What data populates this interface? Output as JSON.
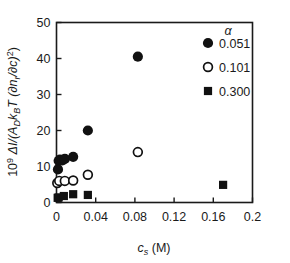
{
  "chart_data": {
    "type": "scatter",
    "title": "",
    "xlabel": "c_s (M)",
    "ylabel": "10^9 ΔI/(A_D k_B T (∂n_r/∂c)^2)",
    "xlim": [
      0,
      0.2
    ],
    "ylim": [
      0,
      50
    ],
    "xticks": [
      "0",
      "0.04",
      "0.08",
      "0.12",
      "0.16",
      "0.2"
    ],
    "xtick_values": [
      0,
      0.04,
      0.08,
      0.12,
      0.16,
      0.2
    ],
    "yticks": [
      "0",
      "10",
      "20",
      "30",
      "40",
      "50"
    ],
    "ytick_values": [
      0,
      10,
      20,
      30,
      40,
      50
    ],
    "grid": false,
    "legend_position": "top-right",
    "legend_title": "α",
    "series": [
      {
        "name": "0.051",
        "marker": "filled-circle",
        "color": "#111111",
        "points": [
          {
            "x": 0.0015,
            "y": 9.2
          },
          {
            "x": 0.0022,
            "y": 11.6
          },
          {
            "x": 0.0035,
            "y": 11.9
          },
          {
            "x": 0.006,
            "y": 11.7
          },
          {
            "x": 0.0085,
            "y": 12.1
          },
          {
            "x": 0.017,
            "y": 12.7
          },
          {
            "x": 0.032,
            "y": 20.0
          },
          {
            "x": 0.083,
            "y": 40.5
          }
        ]
      },
      {
        "name": "0.101",
        "marker": "open-circle",
        "color": "#111111",
        "points": [
          {
            "x": 0.0008,
            "y": 5.4
          },
          {
            "x": 0.0028,
            "y": 6.0
          },
          {
            "x": 0.0085,
            "y": 6.0
          },
          {
            "x": 0.017,
            "y": 6.1
          },
          {
            "x": 0.032,
            "y": 7.7
          },
          {
            "x": 0.083,
            "y": 14.0
          }
        ]
      },
      {
        "name": "0.300",
        "marker": "filled-square",
        "color": "#111111",
        "points": [
          {
            "x": 0.0012,
            "y": 1.3
          },
          {
            "x": 0.0022,
            "y": 1.4
          },
          {
            "x": 0.0075,
            "y": 1.8
          },
          {
            "x": 0.017,
            "y": 2.3
          },
          {
            "x": 0.032,
            "y": 2.1
          },
          {
            "x": 0.17,
            "y": 4.9
          }
        ]
      }
    ]
  },
  "axes": {
    "x_label_main": "c",
    "x_label_sub": "s",
    "x_label_unit": "(M)",
    "y_label_coefficient": "10",
    "y_label_exponent": "9",
    "y_label_body_a": "ΔI/(A",
    "y_label_body_a_sub": "D",
    "y_label_body_b": "k",
    "y_label_body_b_sub": "B",
    "y_label_body_c": "T (∂n",
    "y_label_body_c_sub": "r",
    "y_label_body_d": "/∂c)",
    "y_label_body_d_sup": "2",
    "y_label_body_e": ")"
  },
  "legend": {
    "title": "α",
    "entries": [
      {
        "label": "0.051",
        "marker": "filled-circle"
      },
      {
        "label": "0.101",
        "marker": "open-circle"
      },
      {
        "label": "0.300",
        "marker": "filled-square"
      }
    ]
  }
}
